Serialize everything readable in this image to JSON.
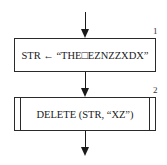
{
  "flowchart": {
    "steps": [
      {
        "number": "1",
        "shape": "process",
        "text": "STR ← “THE□EZNZZXDX”"
      },
      {
        "number": "2",
        "shape": "predefined-process",
        "text": "DELETE (STR, “XZ”)"
      }
    ],
    "line_color": "#1a1a1a"
  }
}
